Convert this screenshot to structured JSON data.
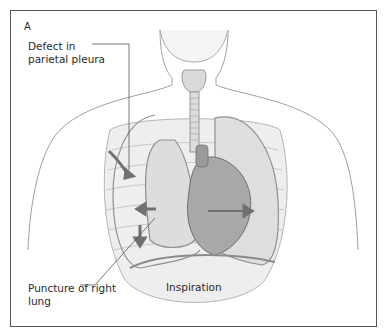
{
  "figure": {
    "panel_label": "A",
    "labels": {
      "defect": "Defect in parietal pleura",
      "puncture": "Puncture of right lung",
      "phase": "Inspiration"
    },
    "colors": {
      "frame": "#555555",
      "outline": "#9a9a9a",
      "fill_body": "#f3f3f3",
      "fill_lung": "#e2e2e2",
      "heart": "#9c9c9c",
      "arrow": "#707070",
      "text": "#2a2a2a"
    }
  }
}
